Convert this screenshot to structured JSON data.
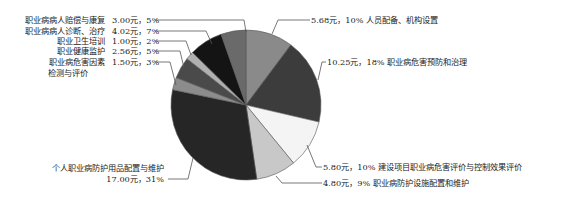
{
  "chart_data": {
    "type": "pie",
    "title": "",
    "unit": "元",
    "start_angle_deg": 0,
    "direction": "clockwise",
    "slices": [
      {
        "label": "人员配备、机构设置",
        "value": 5.68,
        "percent": 10,
        "value_text": "5.68元，10%",
        "color": "#8a8a8a"
      },
      {
        "label": "职业病危害预防和治理",
        "value": 10.25,
        "percent": 18,
        "value_text": "10.25元，18%",
        "color": "#3c3c3c"
      },
      {
        "label": "建设项目职业病危害评价与控制效果评价",
        "value": 5.8,
        "percent": 10,
        "value_text": "5.80元，10%",
        "color": "#f4f4f4"
      },
      {
        "label": "职业病防护设施配置和维护",
        "value": 4.8,
        "percent": 9,
        "value_text": "4.80元，9%",
        "color": "#c8c8c8"
      },
      {
        "label": "个人职业病防护用品配置与维护",
        "value": 17.0,
        "percent": 31,
        "value_text": "17.00元，31%",
        "color": "#262626"
      },
      {
        "label": "职业病危害因素检测与评价",
        "value": 1.5,
        "percent": 3,
        "value_text": "1.50元，3%",
        "color": "#8c8c8c"
      },
      {
        "label": "职业健康监护",
        "value": 2.56,
        "percent": 5,
        "value_text": "2.56元，5%",
        "color": "#4a4a4a"
      },
      {
        "label": "职业卫生培训",
        "value": 1.0,
        "percent": 2,
        "value_text": "1.00元，2%",
        "color": "#b0b0b0"
      },
      {
        "label": "职业病病人诊断、治疗",
        "value": 4.02,
        "percent": 7,
        "value_text": "4.02元，7%",
        "color": "#141414"
      },
      {
        "label": "职业病病人赔偿与康复",
        "value": 3.0,
        "percent": 5,
        "value_text": "3.00元，5%",
        "color": "#6a6a6a"
      }
    ],
    "legend": "none (callout labels)"
  },
  "labels": {
    "left": [
      {
        "name": "职业病病人赔偿与康复",
        "value": "3.00元，5%"
      },
      {
        "name": "职业病病人诊断、治疗",
        "value": "4.02元，7%"
      },
      {
        "name": "职业卫生培训",
        "value": "1.00元，2%"
      },
      {
        "name": "职业健康监护",
        "value": "2.56元，5%"
      },
      {
        "name": "职业病危害因素",
        "name2": "检测与评价",
        "value": "1.50元，3%"
      }
    ],
    "bottom_left": {
      "name": "个人职业病防护用品配置与维护",
      "value": "17.00元，31%"
    },
    "right": [
      {
        "text": "5.68元，10%  人员配备、机构设置"
      },
      {
        "text": "10.25元，18%  职业病危害预防和治理"
      },
      {
        "text": "5.80元，10%  建设项目职业病危害评价与控制效果评价"
      },
      {
        "text": "4.80元，9%  职业病防护设施配置和维护"
      }
    ]
  }
}
